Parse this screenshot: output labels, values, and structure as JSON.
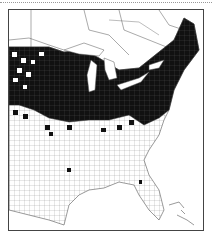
{
  "map": {
    "type": "county distribution map",
    "region": "Eastern United States and southern Canada",
    "colors": {
      "present": "#111111",
      "absent": "#ffffff",
      "boundaries": "#555555",
      "water": "#ffffff"
    }
  }
}
